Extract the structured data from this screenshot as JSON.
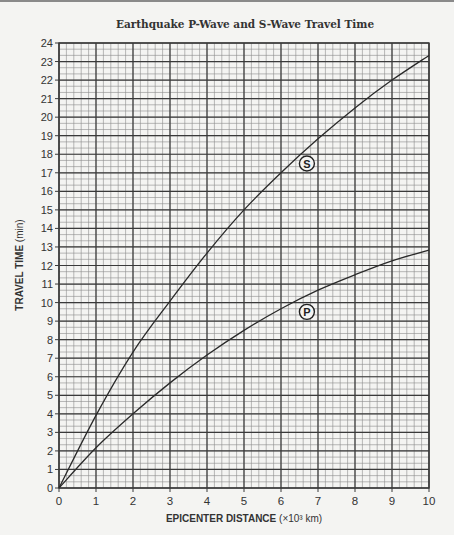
{
  "chart_data": {
    "type": "line",
    "title": "Earthquake P-Wave and S-Wave Travel Time",
    "xlabel": "EPICENTER DISTANCE",
    "xlabel_unit": "(×10³ km)",
    "ylabel": "TRAVEL TIME",
    "ylabel_unit": "(min)",
    "xlim": [
      0,
      10
    ],
    "ylim": [
      0,
      24
    ],
    "x_ticks": [
      0,
      1,
      2,
      3,
      4,
      5,
      6,
      7,
      8,
      9,
      10
    ],
    "y_ticks": [
      0,
      1,
      2,
      3,
      4,
      5,
      6,
      7,
      8,
      9,
      10,
      11,
      12,
      13,
      14,
      15,
      16,
      17,
      18,
      19,
      20,
      21,
      22,
      23,
      24
    ],
    "grid": true,
    "grid_minor": {
      "x_per_unit": 5,
      "y_per_unit": 3
    },
    "x": [
      0,
      1,
      2,
      3,
      4,
      5,
      6,
      7,
      8,
      9,
      10
    ],
    "series": [
      {
        "name": "S",
        "label": "S",
        "values": [
          0,
          3.92,
          7.33,
          10.08,
          12.67,
          15.0,
          17.0,
          18.83,
          20.5,
          22.0,
          23.33
        ],
        "label_pos": [
          6.7,
          17.5
        ]
      },
      {
        "name": "P",
        "label": "P",
        "values": [
          0,
          2.17,
          4.0,
          5.67,
          7.17,
          8.5,
          9.67,
          10.67,
          11.5,
          12.25,
          12.83
        ],
        "label_pos": [
          6.7,
          9.5
        ]
      }
    ],
    "colors": {
      "curve": "#2a2a2a",
      "grid_major": "#3a3a3a",
      "grid_minor": "#8c8c8c",
      "background": "#f4f4f2"
    }
  }
}
